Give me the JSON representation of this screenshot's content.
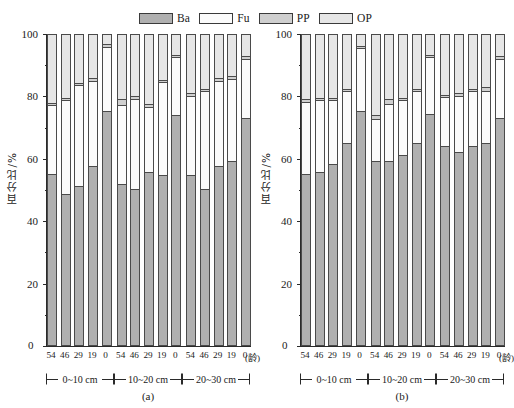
{
  "legend": {
    "position": "top-center",
    "entries": [
      {
        "label": "Ba",
        "color": "#b0b0b0",
        "name": "legend-ba"
      },
      {
        "label": "Fu",
        "color": "#fbfbfb",
        "name": "legend-fu"
      },
      {
        "label": "PP",
        "color": "#cfcfcf",
        "name": "legend-pp"
      },
      {
        "label": "OP",
        "color": "#e6e6e6",
        "name": "legend-op"
      }
    ]
  },
  "axis": {
    "ylabel": "百分比/%",
    "yticks": [
      0,
      20,
      40,
      60,
      80,
      100
    ],
    "ylim": [
      0,
      100
    ],
    "zero_label": "0",
    "age_unit": "(龄)",
    "xtick_labels": [
      "54",
      "46",
      "29",
      "19",
      "0"
    ],
    "depth_labels": [
      "0~10 cm",
      "10~20 cm",
      "20~30 cm"
    ]
  },
  "panels": [
    {
      "caption": "(a)",
      "name": "panel-a"
    },
    {
      "caption": "(b)",
      "name": "panel-b"
    }
  ],
  "chart_data": {
    "type": "bar",
    "subtype": "stacked-percentage",
    "title": "",
    "xlabel": "(龄)",
    "ylabel": "百分比/%",
    "ylim": [
      0,
      100
    ],
    "yticks": [
      0,
      20,
      40,
      60,
      80,
      100
    ],
    "grid": false,
    "legend_position": "top-center",
    "series_order": [
      "Ba",
      "Fu",
      "PP",
      "OP"
    ],
    "series_colors": {
      "Ba": "#b0b0b0",
      "Fu": "#fbfbfb",
      "PP": "#cfcfcf",
      "OP": "#e6e6e6"
    },
    "depth_groups": [
      "0~10 cm",
      "10~20 cm",
      "20~30 cm"
    ],
    "categories": [
      "54",
      "46",
      "29",
      "19",
      "0"
    ],
    "panels": [
      {
        "name": "(a)",
        "groups": [
          {
            "depth": "0~10 cm",
            "bars": [
              {
                "age": "54",
                "Ba": 55.5,
                "Fu": 22.0,
                "PP": 0.5,
                "OP": 22.0
              },
              {
                "age": "46",
                "Ba": 49.0,
                "Fu": 30.0,
                "PP": 0.5,
                "OP": 20.5
              },
              {
                "age": "29",
                "Ba": 51.5,
                "Fu": 32.5,
                "PP": 0.5,
                "OP": 15.5
              },
              {
                "age": "19",
                "Ba": 58.0,
                "Fu": 27.5,
                "PP": 0.5,
                "OP": 14.0
              },
              {
                "age": "0",
                "Ba": 76.0,
                "Fu": 20.5,
                "PP": 0.5,
                "OP": 3.0
              }
            ]
          },
          {
            "depth": "10~20 cm",
            "bars": [
              {
                "age": "54",
                "Ba": 52.0,
                "Fu": 25.5,
                "PP": 1.5,
                "OP": 21.0
              },
              {
                "age": "46",
                "Ba": 50.5,
                "Fu": 29.0,
                "PP": 0.5,
                "OP": 20.0
              },
              {
                "age": "29",
                "Ba": 56.0,
                "Fu": 21.0,
                "PP": 0.5,
                "OP": 22.5
              },
              {
                "age": "19",
                "Ba": 55.0,
                "Fu": 30.0,
                "PP": 0.5,
                "OP": 14.5
              },
              {
                "age": "0",
                "Ba": 74.5,
                "Fu": 18.5,
                "PP": 0.5,
                "OP": 6.5
              }
            ]
          },
          {
            "depth": "20~30 cm",
            "bars": [
              {
                "age": "54",
                "Ba": 55.0,
                "Fu": 25.5,
                "PP": 0.5,
                "OP": 19.0
              },
              {
                "age": "46",
                "Ba": 50.5,
                "Fu": 31.5,
                "PP": 0.5,
                "OP": 17.5
              },
              {
                "age": "29",
                "Ba": 58.0,
                "Fu": 27.5,
                "PP": 0.5,
                "OP": 14.0
              },
              {
                "age": "19",
                "Ba": 59.5,
                "Fu": 26.5,
                "PP": 0.5,
                "OP": 13.5
              },
              {
                "age": "0",
                "Ba": 73.5,
                "Fu": 19.0,
                "PP": 0.5,
                "OP": 7.0
              }
            ]
          }
        ]
      },
      {
        "name": "(b)",
        "groups": [
          {
            "depth": "0~10 cm",
            "bars": [
              {
                "age": "54",
                "Ba": 55.5,
                "Fu": 23.0,
                "PP": 0.5,
                "OP": 21.0
              },
              {
                "age": "46",
                "Ba": 56.0,
                "Fu": 23.0,
                "PP": 0.5,
                "OP": 20.5
              },
              {
                "age": "29",
                "Ba": 58.5,
                "Fu": 20.5,
                "PP": 0.5,
                "OP": 20.5
              },
              {
                "age": "19",
                "Ba": 65.5,
                "Fu": 16.5,
                "PP": 0.5,
                "OP": 17.5
              },
              {
                "age": "0",
                "Ba": 76.0,
                "Fu": 20.0,
                "PP": 0.5,
                "OP": 3.5
              }
            ]
          },
          {
            "depth": "10~20 cm",
            "bars": [
              {
                "age": "54",
                "Ba": 59.5,
                "Fu": 13.5,
                "PP": 1.0,
                "OP": 26.0
              },
              {
                "age": "46",
                "Ba": 59.5,
                "Fu": 18.5,
                "PP": 1.0,
                "OP": 21.0
              },
              {
                "age": "29",
                "Ba": 61.5,
                "Fu": 17.5,
                "PP": 0.5,
                "OP": 20.5
              },
              {
                "age": "19",
                "Ba": 65.5,
                "Fu": 16.5,
                "PP": 0.5,
                "OP": 17.5
              },
              {
                "age": "0",
                "Ba": 75.0,
                "Fu": 18.0,
                "PP": 0.5,
                "OP": 6.5
              }
            ]
          },
          {
            "depth": "20~30 cm",
            "bars": [
              {
                "age": "54",
                "Ba": 64.5,
                "Fu": 15.5,
                "PP": 0.5,
                "OP": 19.5
              },
              {
                "age": "46",
                "Ba": 62.5,
                "Fu": 18.0,
                "PP": 0.5,
                "OP": 19.0
              },
              {
                "age": "29",
                "Ba": 64.5,
                "Fu": 17.5,
                "PP": 0.5,
                "OP": 17.5
              },
              {
                "age": "19",
                "Ba": 65.5,
                "Fu": 16.5,
                "PP": 1.0,
                "OP": 17.0
              },
              {
                "age": "0",
                "Ba": 73.5,
                "Fu": 19.0,
                "PP": 0.5,
                "OP": 7.0
              }
            ]
          }
        ]
      }
    ]
  }
}
